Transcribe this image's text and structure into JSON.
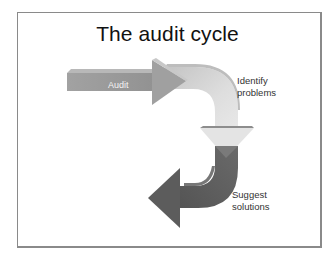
{
  "slide": {
    "title": "The audit cycle",
    "steps": [
      {
        "label": "Audit",
        "color": "#9a9a9a"
      },
      {
        "label": "Identify problems",
        "line1": "Identify",
        "line2": "problems",
        "color": "#d4d4d4"
      },
      {
        "label": "Suggest solutions",
        "line1": "Suggest",
        "line2": "solutions",
        "color": "#5e5e5e"
      }
    ]
  }
}
